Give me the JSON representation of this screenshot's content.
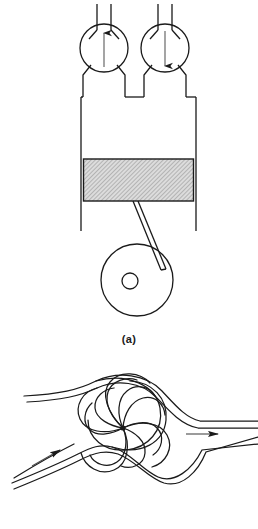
{
  "figure": {
    "background_color": "#ffffff",
    "line_color": "#1a1a1a",
    "piston_fill_color": "#d8d8d8",
    "width": 258,
    "height": 529
  },
  "panels": [
    {
      "id": "a",
      "caption": "(a)",
      "description": "Piston-cylinder assembly with intake and exhaust valves and crankshaft",
      "components": {
        "intake_valve": {
          "label": "intake valve",
          "arrow_direction": "up",
          "center_x": 104,
          "center_y": 48,
          "radius": 24
        },
        "exhaust_valve": {
          "label": "exhaust valve",
          "arrow_direction": "down",
          "center_x": 165,
          "center_y": 48,
          "radius": 24
        },
        "cylinder": {
          "label": "cylinder",
          "left": 81,
          "right": 196,
          "top": 97,
          "bottom": 231
        },
        "piston": {
          "label": "piston",
          "hatched": true,
          "left": 84,
          "right": 194,
          "top": 159,
          "bottom": 201
        },
        "connecting_rod": {
          "label": "connecting rod"
        },
        "crankshaft": {
          "label": "crankshaft",
          "center_x": 137,
          "center_y": 280,
          "radius": 36
        },
        "crank_journal": {
          "label": "crank journal",
          "center_x": 130,
          "center_y": 281,
          "radius": 8
        },
        "crank_pin": {
          "label": "crank pin",
          "x": 162,
          "y": 271
        }
      }
    },
    {
      "id": "c",
      "caption": "(c)",
      "description": "Streamline pattern of a spiral vortex in a duct with inlet and outlet flow",
      "components": {
        "vortex_core": {
          "label": "vortex core",
          "center_x": 123,
          "center_y": 428,
          "arm_count": 8
        },
        "inlet_flow": {
          "label": "inlet flow",
          "arrow_direction": "up-right",
          "arrow_x": 48,
          "arrow_y": 455
        },
        "outlet_flow": {
          "label": "outlet flow",
          "arrow_direction": "right",
          "arrow_x": 210,
          "arrow_y": 434
        }
      }
    }
  ]
}
